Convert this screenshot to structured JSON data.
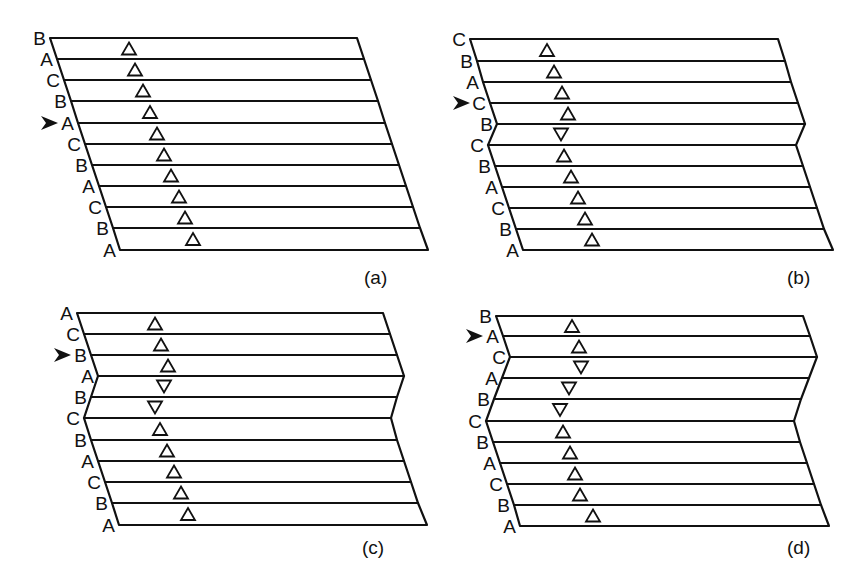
{
  "figure": {
    "panels": [
      {
        "id": "a",
        "caption": "(a)",
        "labels": [
          "B",
          "A",
          "C",
          "B",
          "A",
          "C",
          "B",
          "A",
          "C",
          "B",
          "A"
        ],
        "arrow_row": 4,
        "line_y": [
          38,
          59,
          80,
          101,
          123,
          144,
          165,
          186,
          207,
          228,
          250
        ],
        "left_x": [
          50,
          57,
          64,
          71,
          78,
          85,
          92,
          99,
          106,
          113,
          120
        ],
        "right_x": [
          357,
          364,
          371,
          378,
          385,
          392,
          399,
          406,
          413,
          420,
          428
        ],
        "triangles": [
          {
            "x": 129,
            "dir": "up"
          },
          {
            "x": 135,
            "dir": "up"
          },
          {
            "x": 143,
            "dir": "up"
          },
          {
            "x": 150,
            "dir": "up"
          },
          {
            "x": 157,
            "dir": "up"
          },
          {
            "x": 164,
            "dir": "up"
          },
          {
            "x": 171,
            "dir": "up"
          },
          {
            "x": 179,
            "dir": "up"
          },
          {
            "x": 185,
            "dir": "up"
          },
          {
            "x": 193,
            "dir": "up"
          }
        ],
        "caption_pos": {
          "x": 364,
          "y": 284
        }
      },
      {
        "id": "b",
        "caption": "(b)",
        "labels": [
          "C",
          "B",
          "A",
          "C",
          "B",
          "C",
          "B",
          "A",
          "C",
          "B",
          "A"
        ],
        "arrow_row": 3,
        "line_y": [
          39,
          61,
          82,
          103,
          124,
          145,
          166,
          187,
          208,
          229,
          250
        ],
        "left_x": [
          470,
          477,
          483,
          490,
          497,
          488,
          495,
          502,
          509,
          516,
          523
        ],
        "right_x": [
          778,
          785,
          791,
          798,
          805,
          796,
          803,
          810,
          817,
          824,
          833
        ],
        "triangles": [
          {
            "x": 547,
            "dir": "up"
          },
          {
            "x": 554,
            "dir": "up"
          },
          {
            "x": 562,
            "dir": "up"
          },
          {
            "x": 568,
            "dir": "up"
          },
          {
            "x": 561,
            "dir": "down"
          },
          {
            "x": 564,
            "dir": "up"
          },
          {
            "x": 571,
            "dir": "up"
          },
          {
            "x": 578,
            "dir": "up"
          },
          {
            "x": 585,
            "dir": "up"
          },
          {
            "x": 592,
            "dir": "up"
          }
        ],
        "caption_pos": {
          "x": 787,
          "y": 284
        }
      },
      {
        "id": "c",
        "caption": "(c)",
        "labels": [
          "A",
          "C",
          "B",
          "A",
          "B",
          "C",
          "B",
          "A",
          "C",
          "B",
          "A"
        ],
        "arrow_row": 2,
        "line_y": [
          313,
          334,
          355,
          376,
          397,
          418,
          440,
          461,
          482,
          503,
          525
        ],
        "left_x": [
          77,
          84,
          91,
          98,
          91,
          84,
          91,
          98,
          105,
          112,
          119
        ],
        "right_x": [
          383,
          390,
          397,
          404,
          397,
          391,
          397,
          404,
          411,
          418,
          427
        ],
        "triangles": [
          {
            "x": 155,
            "dir": "up"
          },
          {
            "x": 161,
            "dir": "up"
          },
          {
            "x": 168,
            "dir": "up"
          },
          {
            "x": 164,
            "dir": "down"
          },
          {
            "x": 155,
            "dir": "down"
          },
          {
            "x": 160,
            "dir": "up"
          },
          {
            "x": 167,
            "dir": "up"
          },
          {
            "x": 174,
            "dir": "up"
          },
          {
            "x": 181,
            "dir": "up"
          },
          {
            "x": 188,
            "dir": "up"
          }
        ],
        "caption_pos": {
          "x": 362,
          "y": 554
        }
      },
      {
        "id": "d",
        "caption": "(d)",
        "labels": [
          "B",
          "A",
          "C",
          "A",
          "B",
          "C",
          "B",
          "A",
          "C",
          "B",
          "A"
        ],
        "arrow_row": 1,
        "line_y": [
          316,
          336,
          357,
          378,
          399,
          421,
          442,
          463,
          484,
          505,
          526
        ],
        "left_x": [
          496,
          503,
          510,
          502,
          494,
          486,
          493,
          500,
          507,
          514,
          520
        ],
        "right_x": [
          803,
          810,
          817,
          809,
          801,
          794,
          800,
          807,
          814,
          821,
          829
        ],
        "triangles": [
          {
            "x": 572,
            "dir": "up"
          },
          {
            "x": 579,
            "dir": "up"
          },
          {
            "x": 581,
            "dir": "down"
          },
          {
            "x": 569,
            "dir": "down"
          },
          {
            "x": 560,
            "dir": "down"
          },
          {
            "x": 563,
            "dir": "up"
          },
          {
            "x": 570,
            "dir": "up"
          },
          {
            "x": 575,
            "dir": "up"
          },
          {
            "x": 580,
            "dir": "up"
          },
          {
            "x": 593,
            "dir": "up"
          }
        ],
        "caption_pos": {
          "x": 787,
          "y": 554
        }
      }
    ],
    "colors": {
      "ink": "#111111",
      "background": "#ffffff"
    }
  }
}
